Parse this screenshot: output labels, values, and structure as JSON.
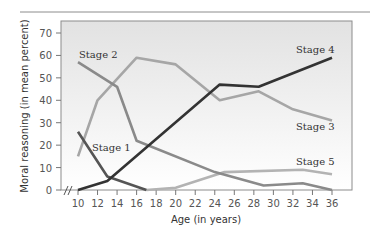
{
  "chart_data": {
    "type": "line",
    "title": "",
    "xlabel": "Age (in years)",
    "ylabel": "Moral reasoning (in mean percent)",
    "xlim": [
      10,
      36
    ],
    "ylim": [
      0,
      70
    ],
    "x_ticks": [
      10,
      12,
      14,
      16,
      18,
      20,
      22,
      24,
      26,
      28,
      30,
      32,
      34,
      36
    ],
    "y_ticks": [
      0,
      10,
      20,
      30,
      40,
      50,
      60,
      70
    ],
    "grid": false,
    "axis_break": "x-axis break marks (//) near origin",
    "legend": "inline labels",
    "series": [
      {
        "name": "Stage 1",
        "color": "#555555",
        "points": [
          [
            10,
            26
          ],
          [
            13,
            6
          ],
          [
            17,
            0
          ]
        ]
      },
      {
        "name": "Stage 2",
        "color": "#8a8a8a",
        "points": [
          [
            10,
            57
          ],
          [
            14,
            46
          ],
          [
            16,
            22
          ],
          [
            24,
            8
          ],
          [
            29,
            2
          ],
          [
            33,
            3
          ],
          [
            36,
            0
          ]
        ]
      },
      {
        "name": "Stage 3",
        "color": "#a6a6a6",
        "points": [
          [
            10,
            15
          ],
          [
            12,
            40
          ],
          [
            16,
            59
          ],
          [
            20,
            56
          ],
          [
            24.5,
            40
          ],
          [
            28.5,
            44
          ],
          [
            32,
            36
          ],
          [
            36,
            31
          ]
        ]
      },
      {
        "name": "Stage 4",
        "color": "#333333",
        "points": [
          [
            10,
            0
          ],
          [
            13,
            4
          ],
          [
            24.5,
            47
          ],
          [
            28.5,
            46
          ],
          [
            36,
            59
          ]
        ]
      },
      {
        "name": "Stage 5",
        "color": "#b3b3b3",
        "points": [
          [
            17,
            0
          ],
          [
            20,
            1
          ],
          [
            25,
            8
          ],
          [
            33,
            9
          ],
          [
            36,
            7
          ]
        ]
      }
    ]
  },
  "labels": {
    "stage1": "Stage 1",
    "stage2": "Stage 2",
    "stage3": "Stage 3",
    "stage4": "Stage 4",
    "stage5": "Stage 5",
    "xlabel": "Age (in years)",
    "ylabel": "Moral reasoning (in mean percent)"
  }
}
